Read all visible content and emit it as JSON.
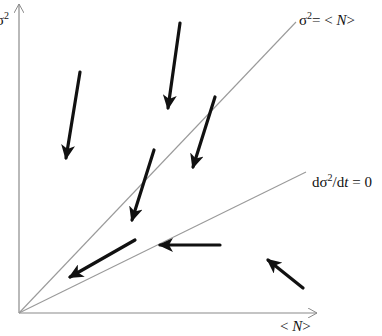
{
  "diagram": {
    "axes": {
      "y_label_base": "σ",
      "y_label_exp": "2",
      "x_label_open": "< ",
      "x_label_var": "N",
      "x_label_close": ">"
    },
    "lines": [
      {
        "name": "poisson-line",
        "label_base": "σ",
        "label_exp": "2",
        "label_eq": "= < ",
        "label_var": "N",
        "label_close": ">"
      },
      {
        "name": "steady-state-line",
        "label_pre": "dσ",
        "label_exp": "2",
        "label_mid": "/d",
        "label_var": "t",
        "label_post": " = 0"
      }
    ],
    "arrows": [
      {
        "from": [
          80,
          72
        ],
        "to": [
          66,
          158
        ]
      },
      {
        "from": [
          180,
          23
        ],
        "to": [
          168,
          108
        ]
      },
      {
        "from": [
          215,
          97
        ],
        "to": [
          193,
          167
        ]
      },
      {
        "from": [
          154,
          150
        ],
        "to": [
          132,
          220
        ]
      },
      {
        "from": [
          135,
          240
        ],
        "to": [
          70,
          277
        ]
      },
      {
        "from": [
          220,
          245
        ],
        "to": [
          160,
          245
        ]
      },
      {
        "from": [
          303,
          288
        ],
        "to": [
          268,
          260
        ]
      }
    ],
    "colors": {
      "axis": "#8a8a8a",
      "guide_line": "#9a9a9a",
      "arrow": "#111111",
      "text": "#111111"
    }
  }
}
